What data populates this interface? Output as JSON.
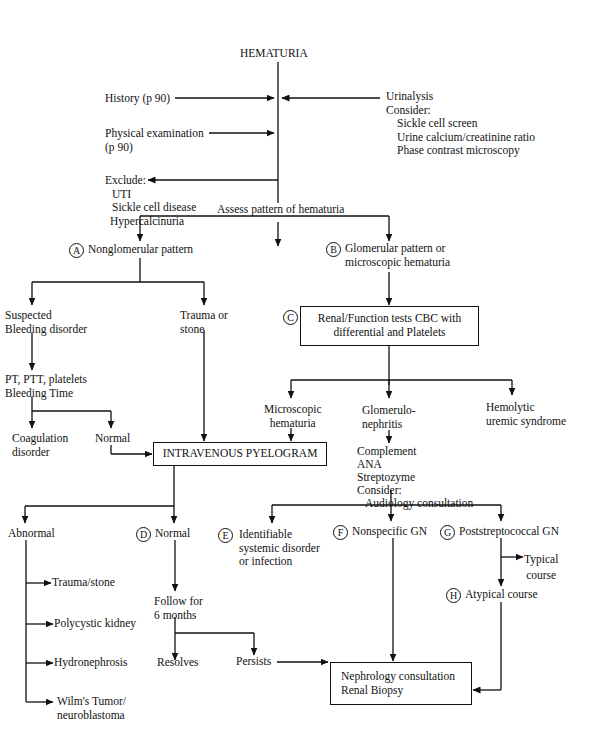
{
  "title": "HEMATURIA",
  "inputs": {
    "history": "History (p 90)",
    "physical_exam": [
      "Physical examination",
      "(p 90)"
    ],
    "urinalysis": "Urinalysis",
    "consider_label": "Consider:",
    "consider_items": [
      "Sickle cell screen",
      "Urine calcium/creatinine ratio",
      "Phase contrast microscopy"
    ],
    "exclude_label": "Exclude:",
    "exclude_items": [
      "UTI",
      "Sickle cell disease",
      "Hypercalcinuria"
    ],
    "assess": "Assess pattern of hematuria"
  },
  "branch_a": {
    "marker": "A",
    "label": "Nonglomerular pattern",
    "bleeding": [
      "Suspected",
      "Bleeding disorder"
    ],
    "trauma": [
      "Trauma or",
      "stone"
    ],
    "tests": [
      "PT, PTT, platelets",
      "Bleeding Time"
    ],
    "coag": [
      "Coagulation",
      "disorder"
    ],
    "normal": "Normal"
  },
  "branch_b": {
    "marker": "B",
    "label": [
      "Glomerular pattern or",
      "microscopic hematuria"
    ]
  },
  "box_c": {
    "marker": "C",
    "lines": [
      "Renal/Function tests",
      "CBC with differential and Platelets"
    ]
  },
  "c_children": {
    "microscopic": [
      "Microscopic",
      "hematuria"
    ],
    "gn": [
      "Glomerulo-",
      "nephritis"
    ],
    "hus": [
      "Hemolytic",
      "uremic syndrome"
    ]
  },
  "gn_workup": {
    "items": [
      "Complement",
      "ANA",
      "Streptozyme",
      "Consider:"
    ],
    "consider": "Audiology consultation"
  },
  "ivp_box": "INTRAVENOUS PYELOGRAM",
  "ivp_results": {
    "abnormal": "Abnormal",
    "abnormal_items": [
      "Trauma/stone",
      "Polycystic kidney",
      "Hydronephrosis",
      "Wilm's Tumor/",
      "neuroblastoma"
    ],
    "normal_marker": "D",
    "normal": "Normal",
    "follow": [
      "Follow for",
      "6 months"
    ],
    "resolves": "Resolves",
    "persists": "Persists"
  },
  "gn_types": {
    "e_marker": "E",
    "e_label": [
      "Identifiable",
      "systemic disorder",
      "or infection"
    ],
    "f_marker": "F",
    "f_label": "Nonspecific GN",
    "g_marker": "G",
    "g_label": "Poststreptococcal GN",
    "typical": [
      "Typical",
      "course"
    ],
    "h_marker": "H",
    "h_label": "Atypical course"
  },
  "nephro_box": [
    "Nephrology consultation",
    "Renal Biopsy"
  ]
}
